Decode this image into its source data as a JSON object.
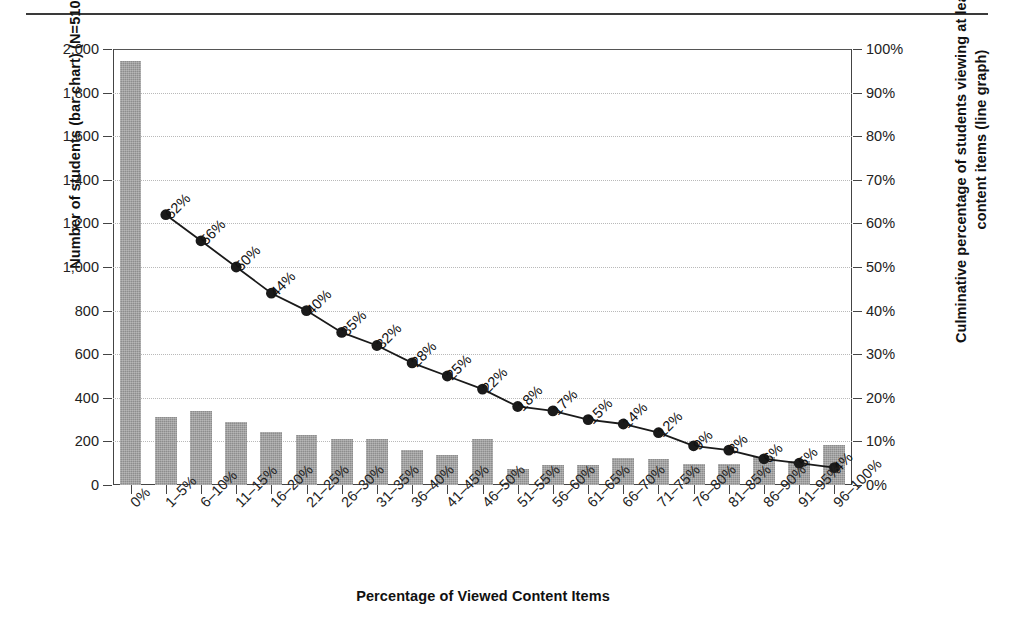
{
  "chart_data": {
    "type": "bar",
    "title": "",
    "xlabel": "Percentage of Viewed Content Items",
    "ylabel_left": "Number of students (bar chart) (N=5108)",
    "ylabel_right": "Culminative percentage of students viewing at least X% of content items (line graph)",
    "grid": true,
    "legend": "none",
    "categories": [
      "0%",
      "1–5%",
      "6–10%",
      "11–15%",
      "16–20%",
      "21–25%",
      "26–30%",
      "31–35%",
      "36–40%",
      "41–45%",
      "46–50%",
      "51–55%",
      "56–60%",
      "61–65%",
      "66–70%",
      "71–75%",
      "76–80%",
      "81–85%",
      "86–90%",
      "91–95%",
      "96–100%"
    ],
    "ylim_left": [
      0,
      2000
    ],
    "ytick_labels_left": [
      "0",
      "200",
      "400",
      "600",
      "800",
      "1,000",
      "1,200",
      "1,400",
      "1,600",
      "1,800",
      "2,000"
    ],
    "ytick_values_left": [
      0,
      200,
      400,
      600,
      800,
      1000,
      1200,
      1400,
      1600,
      1800,
      2000
    ],
    "ylim_right": [
      0,
      100
    ],
    "ytick_labels_right": [
      "0%",
      "10%",
      "20%",
      "30%",
      "40%",
      "50%",
      "60%",
      "70%",
      "80%",
      "90%",
      "100%"
    ],
    "ytick_values_right": [
      0,
      10,
      20,
      30,
      40,
      50,
      60,
      70,
      80,
      90,
      100
    ],
    "series": [
      {
        "name": "Number of students (bar chart)",
        "type": "bar",
        "axis": "left",
        "color": "#8d8d8d",
        "values": [
          1945,
          313,
          340,
          290,
          243,
          228,
          212,
          212,
          160,
          138,
          212,
          72,
          92,
          90,
          122,
          120,
          96,
          98,
          130,
          110,
          185
        ]
      },
      {
        "name": "Culminative percentage of students viewing at least X% of content items (line graph)",
        "type": "line",
        "axis": "right",
        "color": "#1a1a1a",
        "values": [
          null,
          62,
          56,
          50,
          44,
          40,
          35,
          32,
          28,
          25,
          22,
          18,
          17,
          15,
          14,
          12,
          9,
          8,
          6,
          5,
          4
        ],
        "point_labels": [
          "",
          "62%",
          "56%",
          "50%",
          "44%",
          "40%",
          "35%",
          "32%",
          "28%",
          "25%",
          "22%",
          "18%",
          "17%",
          "15%",
          "14%",
          "12%",
          "9%",
          "8%",
          "6%",
          "5%",
          "4%"
        ]
      }
    ]
  }
}
